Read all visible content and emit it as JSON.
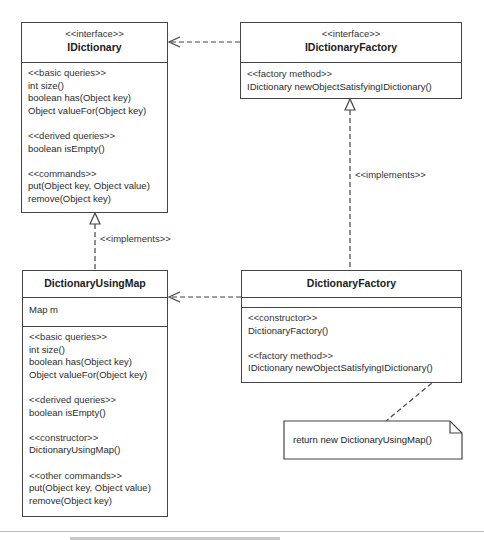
{
  "diagram": {
    "type": "UML class diagram",
    "classes": {
      "idictionary": {
        "stereotype": "<<interface>>",
        "name": "IDictionary",
        "groups": [
          {
            "stereotype": "<<basic queries>>",
            "members": [
              "int size()",
              "boolean has(Object key)",
              "Object valueFor(Object key)"
            ]
          },
          {
            "stereotype": "<<derived queries>>",
            "members": [
              "boolean isEmpty()"
            ]
          },
          {
            "stereotype": "<<commands>>",
            "members": [
              "put(Object key, Object value)",
              "remove(Object key)"
            ]
          }
        ]
      },
      "idictionary_factory": {
        "stereotype": "<<interface>>",
        "name": "IDictionaryFactory",
        "groups": [
          {
            "stereotype": "<<factory method>>",
            "members": [
              "IDictionary newObjectSatisfyingIDictionary()"
            ]
          }
        ]
      },
      "dictionary_using_map": {
        "name": "DictionaryUsingMap",
        "attributes": [
          "Map m"
        ],
        "groups": [
          {
            "stereotype": "<<basic queries>>",
            "members": [
              "int size()",
              "boolean has(Object key)",
              "Object valueFor(Object key)"
            ]
          },
          {
            "stereotype": "<<derived queries>>",
            "members": [
              "boolean isEmpty()"
            ]
          },
          {
            "stereotype": "<<constructor>>",
            "members": [
              "DictionaryUsingMap()"
            ]
          },
          {
            "stereotype": "<<other commands>>",
            "members": [
              "put(Object key, Object value)",
              "remove(Object key)"
            ]
          }
        ]
      },
      "dictionary_factory": {
        "name": "DictionaryFactory",
        "attributes": [],
        "groups": [
          {
            "stereotype": "<<constructor>>",
            "members": [
              "DictionaryFactory()"
            ]
          },
          {
            "stereotype": "<<factory method>>",
            "members": [
              "IDictionary newObjectSatisfyingIDictionary()"
            ]
          }
        ]
      }
    },
    "relationships": [
      {
        "type": "dependency",
        "from": "IDictionaryFactory",
        "to": "IDictionary"
      },
      {
        "type": "realization",
        "from": "DictionaryUsingMap",
        "to": "IDictionary",
        "label": "<<implements>>"
      },
      {
        "type": "realization",
        "from": "DictionaryFactory",
        "to": "IDictionaryFactory",
        "label": "<<implements>>"
      },
      {
        "type": "dependency",
        "from": "DictionaryFactory",
        "to": "DictionaryUsingMap"
      }
    ],
    "note": {
      "text": "return new DictionaryUsingMap()",
      "attached_to": "DictionaryFactory.newObjectSatisfyingIDictionary()"
    },
    "colors": {
      "line": "#444444",
      "text": "#2a2a2a",
      "background": "#ffffff"
    }
  }
}
